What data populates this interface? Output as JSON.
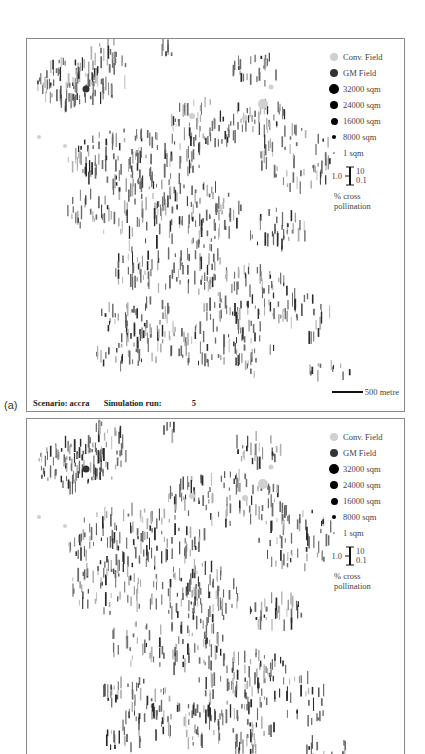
{
  "figure": {
    "panels": [
      {
        "id": "a",
        "label": "(a)",
        "frame": {
          "left": 26,
          "top": 38,
          "width": 379,
          "height": 374
        },
        "seed": 11,
        "caption": {
          "scenario_label": "Scenario: accra",
          "run_label": "Simulation run:",
          "run_value": "5"
        },
        "scale_bar": {
          "label": "500 metre"
        },
        "truncated": false
      },
      {
        "id": "b",
        "label": "",
        "frame": {
          "left": 26,
          "top": 418,
          "width": 379,
          "height": 345
        },
        "seed": 23,
        "caption": null,
        "scale_bar": null,
        "truncated": true
      }
    ],
    "legend": {
      "items": [
        {
          "label": "Conv. Field",
          "symbol": "dot",
          "size": 8,
          "color": "#d0d0d0"
        },
        {
          "label": "GM Field",
          "symbol": "dot",
          "size": 8,
          "color": "#333333"
        },
        {
          "label": "32000 sqm",
          "symbol": "dot",
          "size": 10,
          "color": "#000000"
        },
        {
          "label": "24000 sqm",
          "symbol": "dot",
          "size": 8.5,
          "color": "#000000"
        },
        {
          "label": "16000 sqm",
          "symbol": "dot",
          "size": 7,
          "color": "#000000"
        },
        {
          "label": "8000 sqm",
          "symbol": "dot",
          "size": 4,
          "color": "#000000"
        },
        {
          "label": "1 sqm",
          "symbol": "dot",
          "size": 1.5,
          "color": "#999999"
        }
      ],
      "error_bar": {
        "center_label": "1.0",
        "top_label": "10",
        "bottom_label": "0.1"
      },
      "caption_line1": "% cross",
      "caption_line2": "pollination"
    },
    "colors": {
      "frame": "#8a8a8a",
      "mark_dark": "#2a2a2a",
      "mark_mid": "#6a6a6a",
      "mark_light": "#b0b0b0",
      "conv_field": "#d0d0d0",
      "gm_field": "#333333"
    },
    "map_clusters": [
      {
        "x": 45,
        "y": 45,
        "rx": 35,
        "ry": 25,
        "n": 90
      },
      {
        "x": 80,
        "y": 30,
        "rx": 20,
        "ry": 30,
        "n": 40
      },
      {
        "x": 140,
        "y": 12,
        "rx": 8,
        "ry": 8,
        "n": 6
      },
      {
        "x": 230,
        "y": 30,
        "rx": 25,
        "ry": 15,
        "n": 25
      },
      {
        "x": 200,
        "y": 80,
        "rx": 60,
        "ry": 25,
        "n": 90
      },
      {
        "x": 110,
        "y": 120,
        "rx": 70,
        "ry": 30,
        "n": 130
      },
      {
        "x": 270,
        "y": 120,
        "rx": 40,
        "ry": 30,
        "n": 60
      },
      {
        "x": 90,
        "y": 170,
        "rx": 50,
        "ry": 25,
        "n": 60
      },
      {
        "x": 170,
        "y": 175,
        "rx": 45,
        "ry": 30,
        "n": 90
      },
      {
        "x": 250,
        "y": 190,
        "rx": 30,
        "ry": 20,
        "n": 35
      },
      {
        "x": 140,
        "y": 225,
        "rx": 60,
        "ry": 25,
        "n": 80
      },
      {
        "x": 220,
        "y": 260,
        "rx": 50,
        "ry": 30,
        "n": 90
      },
      {
        "x": 110,
        "y": 280,
        "rx": 40,
        "ry": 20,
        "n": 45
      },
      {
        "x": 170,
        "y": 305,
        "rx": 80,
        "ry": 20,
        "n": 90
      },
      {
        "x": 280,
        "y": 280,
        "rx": 25,
        "ry": 25,
        "n": 25
      },
      {
        "x": 220,
        "y": 325,
        "rx": 15,
        "ry": 12,
        "n": 15
      },
      {
        "x": 300,
        "y": 330,
        "rx": 25,
        "ry": 10,
        "n": 12
      },
      {
        "x": 90,
        "y": 320,
        "rx": 25,
        "ry": 10,
        "n": 15
      }
    ],
    "field_circles": [
      {
        "x": 59,
        "y": 50,
        "r": 3.5,
        "type": "gm"
      },
      {
        "x": 236,
        "y": 65,
        "r": 5,
        "type": "conv"
      },
      {
        "x": 218,
        "y": 79,
        "r": 3,
        "type": "conv"
      },
      {
        "x": 12,
        "y": 98,
        "r": 2,
        "type": "conv"
      },
      {
        "x": 38,
        "y": 107,
        "r": 2,
        "type": "conv"
      },
      {
        "x": 165,
        "y": 77,
        "r": 3,
        "type": "conv"
      },
      {
        "x": 244,
        "y": 48,
        "r": 2.5,
        "type": "conv"
      }
    ]
  }
}
